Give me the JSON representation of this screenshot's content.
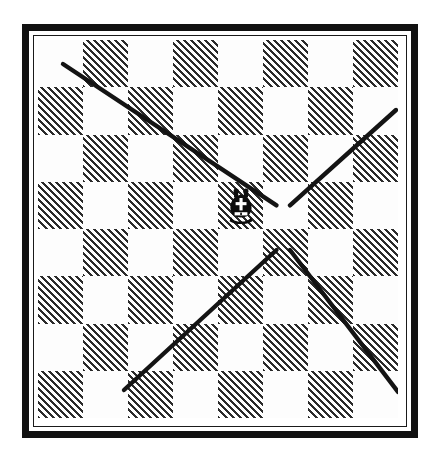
{
  "diagram": {
    "caption": "Chess bishop movement on an 8x8 board",
    "piece": {
      "name": "bishop",
      "color": "black",
      "square": "e5",
      "file_index": 4,
      "rank_index": 3
    },
    "board": {
      "files": 8,
      "ranks": 8,
      "light_square_color": "#fdfdfd",
      "dark_square_color": "#2b2b2b",
      "dark_square_fill": "diagonal-hatch",
      "top_left_square": "light",
      "border_color": "#111111",
      "background_color": "#ffffff"
    },
    "move_lines": [
      {
        "name": "up-left-diagonal",
        "direction": "north-west",
        "squares": 4,
        "from": {
          "x": 238.5,
          "y": 165.4
        },
        "to": {
          "x": 25.0,
          "y": 24.0
        },
        "color": "#141414",
        "width": 4.4
      },
      {
        "name": "up-right-diagonal",
        "direction": "north-east",
        "squares": 3,
        "from": {
          "x": 252.0,
          "y": 165.4
        },
        "to": {
          "x": 358.0,
          "y": 70.0
        },
        "color": "#141414",
        "width": 4.4
      },
      {
        "name": "down-left-diagonal",
        "direction": "south-west",
        "squares": 3,
        "from": {
          "x": 238.5,
          "y": 210.0
        },
        "to": {
          "x": 86.0,
          "y": 350.0
        },
        "color": "#141414",
        "width": 4.4
      },
      {
        "name": "down-right-diagonal",
        "direction": "south-east",
        "squares": 3,
        "from": {
          "x": 252.0,
          "y": 210.0
        },
        "to": {
          "x": 360.0,
          "y": 352.0
        },
        "color": "#141414",
        "width": 4.4
      }
    ]
  },
  "chart_data": {
    "type": "diagram",
    "grid": "8x8",
    "piece_position": "e5",
    "directions": [
      "north-west",
      "north-east",
      "south-west",
      "south-east"
    ],
    "ray_lengths": [
      4,
      3,
      3,
      3
    ],
    "squares": [
      [
        "light",
        "dark",
        "light",
        "dark",
        "light",
        "dark",
        "light",
        "dark"
      ],
      [
        "dark",
        "light",
        "dark",
        "light",
        "dark",
        "light",
        "dark",
        "light"
      ],
      [
        "light",
        "dark",
        "light",
        "dark",
        "light",
        "dark",
        "light",
        "dark"
      ],
      [
        "dark",
        "light",
        "dark",
        "light",
        "dark",
        "light",
        "dark",
        "light"
      ],
      [
        "light",
        "dark",
        "light",
        "dark",
        "light",
        "dark",
        "light",
        "dark"
      ],
      [
        "dark",
        "light",
        "dark",
        "light",
        "dark",
        "light",
        "dark",
        "light"
      ],
      [
        "light",
        "dark",
        "light",
        "dark",
        "light",
        "dark",
        "light",
        "dark"
      ],
      [
        "dark",
        "light",
        "dark",
        "light",
        "dark",
        "light",
        "dark",
        "light"
      ]
    ]
  }
}
